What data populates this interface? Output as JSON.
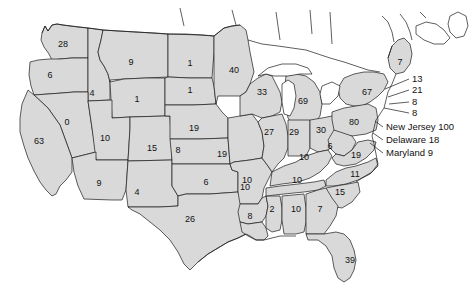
{
  "map": {
    "title": "United States choropleth with per-state numeric values",
    "background_color": "#ffffff",
    "state_fill_color": "#d9d9d9",
    "border_color": "#1a1a1a",
    "text_color": "#111111",
    "state_values": [
      {
        "code": "WA",
        "name": "Washington",
        "value": "28",
        "x": 63,
        "y": 44
      },
      {
        "code": "OR",
        "name": "Oregon",
        "value": "6",
        "x": 50,
        "y": 75
      },
      {
        "code": "ID",
        "name": "Idaho",
        "value": "4",
        "x": 92,
        "y": 93
      },
      {
        "code": "MT",
        "name": "Montana",
        "value": "9",
        "x": 131,
        "y": 62
      },
      {
        "code": "ND",
        "name": "North Dakota",
        "value": "1",
        "x": 190,
        "y": 63
      },
      {
        "code": "MN",
        "name": "Minnesota",
        "value": "40",
        "x": 234,
        "y": 70
      },
      {
        "code": "SD",
        "name": "South Dakota",
        "value": "1",
        "x": 190,
        "y": 90
      },
      {
        "code": "WY",
        "name": "Wyoming",
        "value": "1",
        "x": 137,
        "y": 99
      },
      {
        "code": "NV",
        "name": "Nevada",
        "value": "0",
        "x": 67,
        "y": 122
      },
      {
        "code": "CA",
        "name": "California",
        "value": "63",
        "x": 39,
        "y": 141
      },
      {
        "code": "UT",
        "name": "Utah",
        "value": "10",
        "x": 105,
        "y": 138
      },
      {
        "code": "CO",
        "name": "Colorado",
        "value": "15",
        "x": 152,
        "y": 148
      },
      {
        "code": "NE",
        "name": "Nebraska",
        "value": "19",
        "x": 194,
        "y": 128
      },
      {
        "code": "IA",
        "name": "Iowa",
        "value": "19",
        "x": 222,
        "y": 154
      },
      {
        "code": "WI",
        "name": "Wisconsin",
        "value": "33",
        "x": 262,
        "y": 92
      },
      {
        "code": "MI",
        "name": "Michigan",
        "value": "69",
        "x": 303,
        "y": 101
      },
      {
        "code": "IL",
        "name": "Illinois",
        "value": "27",
        "x": 269,
        "y": 132
      },
      {
        "code": "IN",
        "name": "Indiana",
        "value": "29",
        "x": 294,
        "y": 132
      },
      {
        "code": "OH",
        "name": "Ohio",
        "value": "30",
        "x": 321,
        "y": 130
      },
      {
        "code": "PA",
        "name": "Pennsylvania",
        "value": "80",
        "x": 354,
        "y": 122
      },
      {
        "code": "NY",
        "name": "New York",
        "value": "67",
        "x": 367,
        "y": 92
      },
      {
        "code": "ME",
        "name": "Maine",
        "value": "7",
        "x": 400,
        "y": 62
      },
      {
        "code": "KS",
        "name": "Kansas",
        "value": "8",
        "x": 178,
        "y": 150
      },
      {
        "code": "MO",
        "name": "Missouri",
        "value": "10",
        "x": 245,
        "y": 187
      },
      {
        "code": "AZ",
        "name": "Arizona",
        "value": "9",
        "x": 99,
        "y": 183
      },
      {
        "code": "NM",
        "name": "New Mexico",
        "value": "4",
        "x": 137,
        "y": 192
      },
      {
        "code": "OK",
        "name": "Oklahoma",
        "value": "6",
        "x": 206,
        "y": 182
      },
      {
        "code": "TX",
        "name": "Texas",
        "value": "26",
        "x": 190,
        "y": 219
      },
      {
        "code": "AR",
        "name": "Arkansas",
        "value": "10",
        "x": 247,
        "y": 180
      },
      {
        "code": "LA",
        "name": "Louisiana",
        "value": "8",
        "x": 250,
        "y": 216
      },
      {
        "code": "MS",
        "name": "Mississippi",
        "value": "2",
        "x": 272,
        "y": 209
      },
      {
        "code": "AL",
        "name": "Alabama",
        "value": "10",
        "x": 296,
        "y": 209
      },
      {
        "code": "TN",
        "name": "Tennessee",
        "value": "10",
        "x": 297,
        "y": 180
      },
      {
        "code": "KY",
        "name": "Kentucky",
        "value": "10",
        "x": 304,
        "y": 157
      },
      {
        "code": "WV",
        "name": "West Virginia",
        "value": "6",
        "x": 330,
        "y": 146
      },
      {
        "code": "VA",
        "name": "Virginia",
        "value": "19",
        "x": 356,
        "y": 155
      },
      {
        "code": "NC",
        "name": "North Carolina",
        "value": "11",
        "x": 355,
        "y": 174
      },
      {
        "code": "SC",
        "name": "South Carolina",
        "value": "15",
        "x": 340,
        "y": 192
      },
      {
        "code": "GA",
        "name": "Georgia",
        "value": "7",
        "x": 320,
        "y": 209
      },
      {
        "code": "FL",
        "name": "Florida",
        "value": "39",
        "x": 350,
        "y": 260
      }
    ],
    "callouts": [
      {
        "name": "vermont-new-hampshire",
        "text": "13",
        "x": 412,
        "y": 79,
        "leader": "M 385 89 L 409 79"
      },
      {
        "name": "massachusetts",
        "text": "21",
        "x": 412,
        "y": 90,
        "leader": "M 388 97 L 409 90"
      },
      {
        "name": "rhode-island",
        "text": "8",
        "x": 412,
        "y": 102,
        "leader": "M 389 104 L 409 102"
      },
      {
        "name": "connecticut",
        "text": "8",
        "x": 412,
        "y": 113,
        "leader": "M 384 108 L 409 113"
      },
      {
        "name": "new-jersey",
        "text": "New Jersey 100",
        "x": 386,
        "y": 127,
        "leader": "M 375 121 L 383 127"
      },
      {
        "name": "delaware",
        "text": "Delaware 18",
        "x": 386,
        "y": 140,
        "leader": "M 373 133 L 383 140"
      },
      {
        "name": "maryland",
        "text": "Maryland 9",
        "x": 386,
        "y": 153,
        "leader": "M 370 143 L 383 153"
      }
    ]
  }
}
